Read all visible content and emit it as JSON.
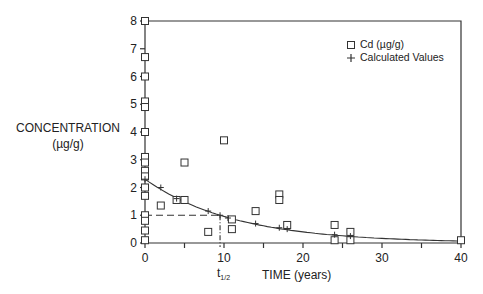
{
  "chart_data": {
    "type": "scatter",
    "title": "",
    "xlabel": "TIME (years)",
    "ylabel": "CONCENTRATION (µg/g)",
    "xlim": [
      0,
      40
    ],
    "ylim": [
      0,
      8
    ],
    "xticks": [
      0,
      10,
      20,
      30,
      40
    ],
    "yticks": [
      0,
      1,
      2,
      3,
      4,
      5,
      6,
      7,
      8
    ],
    "grid": false,
    "legend_position": "upper right",
    "annotations": [
      {
        "text": "t1/2",
        "x": 9.5,
        "note": "half-life marker; dashed lines from y=1 to curve and down to x-axis"
      }
    ],
    "series": [
      {
        "name": "Cd (µg/g)",
        "marker": "square",
        "points": [
          [
            0,
            8.0
          ],
          [
            0,
            6.7
          ],
          [
            0,
            6.0
          ],
          [
            0,
            5.1
          ],
          [
            0,
            4.9
          ],
          [
            0,
            4.0
          ],
          [
            0,
            3.1
          ],
          [
            0,
            2.9
          ],
          [
            0,
            2.6
          ],
          [
            0,
            2.4
          ],
          [
            0,
            2.0
          ],
          [
            0,
            1.7
          ],
          [
            0,
            1.0
          ],
          [
            0,
            0.8
          ],
          [
            0,
            0.45
          ],
          [
            0,
            0.1
          ],
          [
            2,
            1.35
          ],
          [
            4,
            1.55
          ],
          [
            5,
            1.55
          ],
          [
            5,
            2.9
          ],
          [
            8,
            0.4
          ],
          [
            10,
            3.7
          ],
          [
            11,
            0.85
          ],
          [
            11,
            0.5
          ],
          [
            14,
            1.15
          ],
          [
            17,
            1.75
          ],
          [
            17,
            1.55
          ],
          [
            18,
            0.65
          ],
          [
            24,
            0.65
          ],
          [
            24,
            0.1
          ],
          [
            26,
            0.4
          ],
          [
            26,
            0.1
          ],
          [
            40,
            0.1
          ]
        ]
      },
      {
        "name": "Calculated Values",
        "marker": "plus",
        "points": [
          [
            0,
            2.3
          ],
          [
            2,
            2.0
          ],
          [
            4,
            1.6
          ],
          [
            8,
            1.15
          ],
          [
            9.5,
            1.0
          ],
          [
            10.5,
            0.9
          ],
          [
            14,
            0.7
          ],
          [
            17,
            0.55
          ],
          [
            18,
            0.5
          ],
          [
            24,
            0.3
          ],
          [
            26,
            0.25
          ]
        ],
        "fit_curve": "exponential decay, C = 2.3 * exp(-0.0875 t), ending ~0.08 at t=40"
      }
    ]
  },
  "labels": {
    "ylabel_line1": "CONCENTRATION",
    "ylabel_line2": "(µg/g)",
    "xlabel": "TIME (years)",
    "thalf_t": "t",
    "thalf_sub": "1/2",
    "legend_cd": "Cd (µg/g)",
    "legend_calc": "Calculated Values",
    "xtick_labels": [
      "0",
      "10",
      "20",
      "30",
      "40"
    ],
    "ytick_labels": [
      "0",
      "1",
      "2",
      "3",
      "4",
      "5",
      "6",
      "7",
      "8"
    ]
  }
}
